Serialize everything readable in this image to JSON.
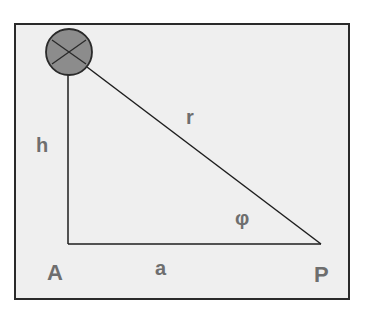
{
  "diagram": {
    "labels": {
      "height": "h",
      "hypotenuse": "r",
      "angle": "φ",
      "point_a": "A",
      "base": "a",
      "point_p": "P"
    },
    "colors": {
      "background": "#efefef",
      "frame": "#2a2a2a",
      "line": "#1e1e1e",
      "source_fill": "#8c8c8c",
      "label": "#6e6e6e"
    }
  }
}
